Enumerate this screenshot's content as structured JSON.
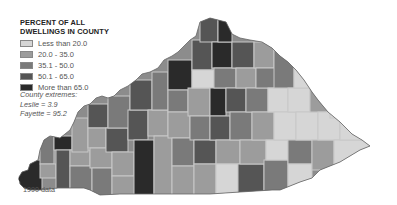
{
  "legend": {
    "title_line1": "PERCENT OF ALL",
    "title_line2": "DWELLINGS IN COUNTY",
    "items": [
      {
        "label": "Less than 20.0",
        "color": "#d6d6d6"
      },
      {
        "label": "20.0 - 35.0",
        "color": "#9c9c9c"
      },
      {
        "label": "35.1 - 50.0",
        "color": "#7a7a7a"
      },
      {
        "label": "50.1 - 65.0",
        "color": "#555555"
      },
      {
        "label": "More than 65.0",
        "color": "#2a2a2a"
      }
    ]
  },
  "extremes": {
    "heading": "County extremes:",
    "min": "Leslie = 3.9",
    "max": "Fayette = 95.2"
  },
  "footnote": "1990 data",
  "map": {
    "region": "Kentucky",
    "border_color": "#c8c8c8"
  }
}
